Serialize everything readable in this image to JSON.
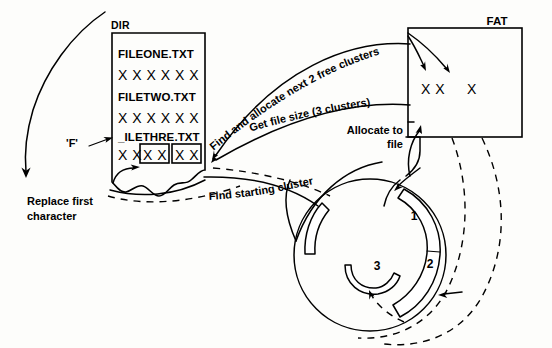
{
  "diagram": {
    "ink_color": "#000000",
    "background_color": "#fdfdfb"
  },
  "dir": {
    "heading": "DIR",
    "entries": [
      {
        "name": "FILEONE.TXT",
        "data": "X X X X X X"
      },
      {
        "name": "FILETWO.TXT",
        "data": "X X X X X X"
      }
    ],
    "deleted_entry": {
      "name": "_ILETHRE.TXT",
      "free_pair": "X X",
      "boxed_pair_1": "X X",
      "boxed_pair_2": "X X"
    }
  },
  "fat": {
    "heading": "FAT",
    "allocated_pair": "X X",
    "existing_entry": "X"
  },
  "annotations": {
    "replace_char": {
      "line1": "Replace first",
      "line2": "character"
    },
    "char_label": "'F'",
    "find_allocate": "Find and allocate next 2 free clusters",
    "get_file_size": "Get file size (3 clusters)",
    "allocate_to_file": {
      "line1": "Allocate to",
      "line2": "file"
    },
    "find_starting_cluster": "Find starting cluster"
  },
  "disk": {
    "clusters": [
      {
        "label": "1"
      },
      {
        "label": "2"
      },
      {
        "label": "3"
      }
    ]
  }
}
